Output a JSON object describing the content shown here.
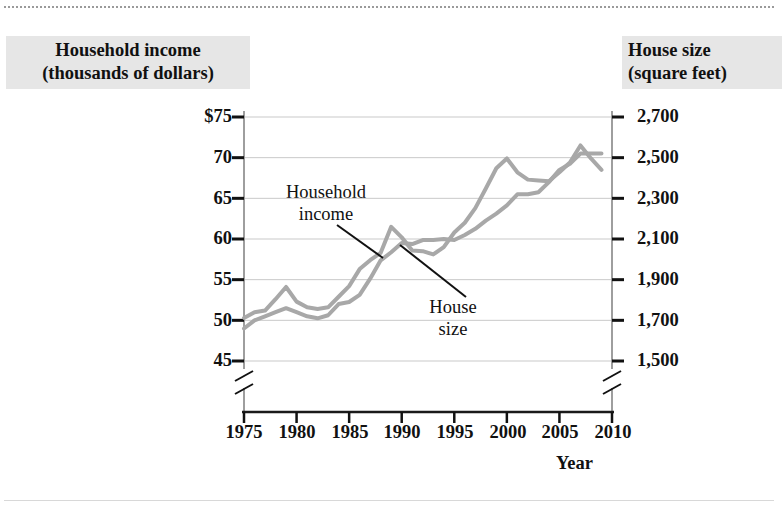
{
  "figure": {
    "left_axis_title": "Household income\n(thousands of dollars)",
    "right_axis_title": "House size\n(square feet)",
    "x_axis_name": "Year",
    "series_label_income": "Household\nincome",
    "series_label_housesize": "House\nsize"
  },
  "chart_data": {
    "type": "line",
    "title": "",
    "xlabel": "Year",
    "ylabel": "Household income (thousands of dollars)",
    "y2label": "House size (square feet)",
    "xlim": [
      1975,
      2010
    ],
    "ylim": [
      45,
      75
    ],
    "y2lim": [
      1500,
      2700
    ],
    "grid": true,
    "legend": "inline-annotations",
    "axis_break": true,
    "xticks": [
      "1975",
      "1980",
      "1985",
      "1990",
      "1995",
      "2000",
      "2005",
      "2010"
    ],
    "xtick_values": [
      1975,
      1980,
      1985,
      1990,
      1995,
      2000,
      2005,
      2010
    ],
    "yticks": [
      "$75",
      "70",
      "65",
      "60",
      "55",
      "50",
      "45"
    ],
    "ytick_values": [
      75,
      70,
      65,
      60,
      55,
      50,
      45
    ],
    "y2ticks": [
      "2,700",
      "2,500",
      "2,300",
      "2,100",
      "1,900",
      "1,700",
      "1,500"
    ],
    "y2tick_values": [
      2700,
      2500,
      2300,
      2100,
      1900,
      1700,
      1500
    ],
    "line_color": "#a8a8a8",
    "series": [
      {
        "name": "Household income",
        "axis": "left",
        "units": "thousands of dollars",
        "x": [
          1975,
          1976,
          1977,
          1978,
          1979,
          1980,
          1981,
          1982,
          1983,
          1984,
          1985,
          1986,
          1987,
          1988,
          1989,
          1990,
          1991,
          1992,
          1993,
          1994,
          1995,
          1996,
          1997,
          1998,
          1999,
          2000,
          2001,
          2002,
          2003,
          2004,
          2005,
          2006,
          2007,
          2008,
          2009
        ],
        "values": [
          50.3,
          51.0,
          51.2,
          52.6,
          54.1,
          52.3,
          51.6,
          51.4,
          51.6,
          52.9,
          54.2,
          56.3,
          57.4,
          58.3,
          61.5,
          60.2,
          58.6,
          58.5,
          58.1,
          59.0,
          60.8,
          62.0,
          63.8,
          66.2,
          68.7,
          69.9,
          68.2,
          67.3,
          67.2,
          67.1,
          68.2,
          69.4,
          71.5,
          69.9,
          68.5
        ]
      },
      {
        "name": "House size",
        "axis": "right",
        "units": "square feet",
        "x": [
          1975,
          1976,
          1977,
          1978,
          1979,
          1980,
          1981,
          1982,
          1983,
          1984,
          1985,
          1986,
          1987,
          1988,
          1989,
          1990,
          1991,
          1992,
          1993,
          1994,
          1995,
          1996,
          1997,
          1998,
          1999,
          2000,
          2001,
          2002,
          2003,
          2004,
          2005,
          2006,
          2007,
          2008,
          2009
        ],
        "values": [
          1660,
          1700,
          1720,
          1740,
          1760,
          1740,
          1720,
          1710,
          1725,
          1780,
          1790,
          1825,
          1905,
          1995,
          2035,
          2080,
          2075,
          2095,
          2095,
          2100,
          2095,
          2120,
          2150,
          2190,
          2225,
          2265,
          2320,
          2320,
          2330,
          2380,
          2440,
          2470,
          2520,
          2520,
          2520
        ]
      }
    ]
  }
}
